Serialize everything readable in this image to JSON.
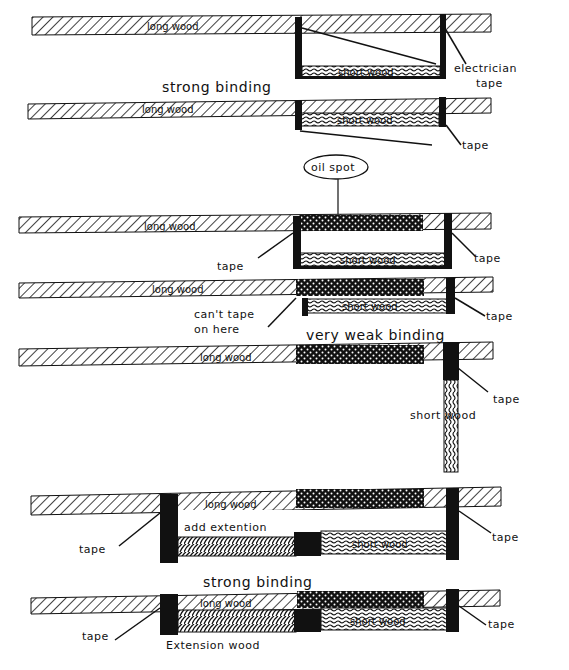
{
  "diagram": {
    "colors": {
      "ink": "#111111",
      "background": "#ffffff"
    },
    "panels": [
      {
        "id": "panel-1",
        "labels": {
          "long_wood": "long wood",
          "short_wood": "short wood",
          "callout": "electrician",
          "callout2": "tape"
        }
      },
      {
        "id": "panel-2",
        "heading": "strong binding",
        "labels": {
          "long_wood": "long wood",
          "short_wood": "short wood",
          "tape": "tape"
        }
      },
      {
        "id": "panel-3",
        "bubble": "oil spot",
        "labels": {
          "long_wood": "long wood",
          "short_wood": "short wood",
          "tape_left": "tape",
          "tape_right": "tape"
        }
      },
      {
        "id": "panel-4",
        "labels": {
          "long_wood": "long wood",
          "short_wood": "short wood",
          "note_line1": "can't tape",
          "note_line2": "on here",
          "tape": "tape"
        },
        "caption": "very weak binding"
      },
      {
        "id": "panel-5",
        "labels": {
          "long_wood": "long wood",
          "short_wood": "short wood",
          "tape": "tape"
        }
      },
      {
        "id": "panel-6",
        "labels": {
          "long_wood": "long wood",
          "short_wood": "short wood",
          "extension_note": "add extention",
          "tape_left": "tape",
          "tape_right": "tape"
        }
      },
      {
        "id": "panel-7",
        "heading": "strong binding",
        "labels": {
          "long_wood": "long wood",
          "short_wood": "short wood",
          "extension_wood": "Extension wood",
          "tape_left": "tape",
          "tape_right": "tape"
        }
      }
    ],
    "legend_patterns": {
      "long_wood": "diagonal-hatch",
      "short_wood": "wavy-hatch",
      "oil_spot": "dotted-dark",
      "extension_wood": "braided-hatch",
      "tape": "solid-black"
    }
  }
}
